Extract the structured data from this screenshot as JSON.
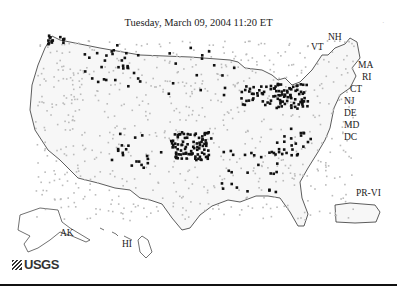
{
  "title": "Tuesday, March 09, 2004 11:20 ET",
  "logo": {
    "text": "USGS",
    "icon": "usgs-logo-icon"
  },
  "state_labels": [
    {
      "id": "nh",
      "text": "NH",
      "x": 328,
      "y": 40
    },
    {
      "id": "vt",
      "text": "VT",
      "x": 311,
      "y": 50
    },
    {
      "id": "ma",
      "text": "MA",
      "x": 358,
      "y": 68
    },
    {
      "id": "ri",
      "text": "RI",
      "x": 362,
      "y": 80
    },
    {
      "id": "ct",
      "text": "CT",
      "x": 350,
      "y": 92
    },
    {
      "id": "nj",
      "text": "NJ",
      "x": 344,
      "y": 104
    },
    {
      "id": "de",
      "text": "DE",
      "x": 344,
      "y": 116
    },
    {
      "id": "md",
      "text": "MD",
      "x": 344,
      "y": 128
    },
    {
      "id": "dc",
      "text": "DC",
      "x": 344,
      "y": 140
    },
    {
      "id": "ak",
      "text": "AK",
      "x": 60,
      "y": 236
    },
    {
      "id": "hi",
      "text": "HI",
      "x": 122,
      "y": 247
    },
    {
      "id": "pr-vi",
      "text": "PR-VI",
      "x": 356,
      "y": 196
    }
  ],
  "colors": {
    "outline": "#333333",
    "dot_dark": "#111111",
    "dot_light": "#bbbbbb",
    "rule": "#111111"
  }
}
